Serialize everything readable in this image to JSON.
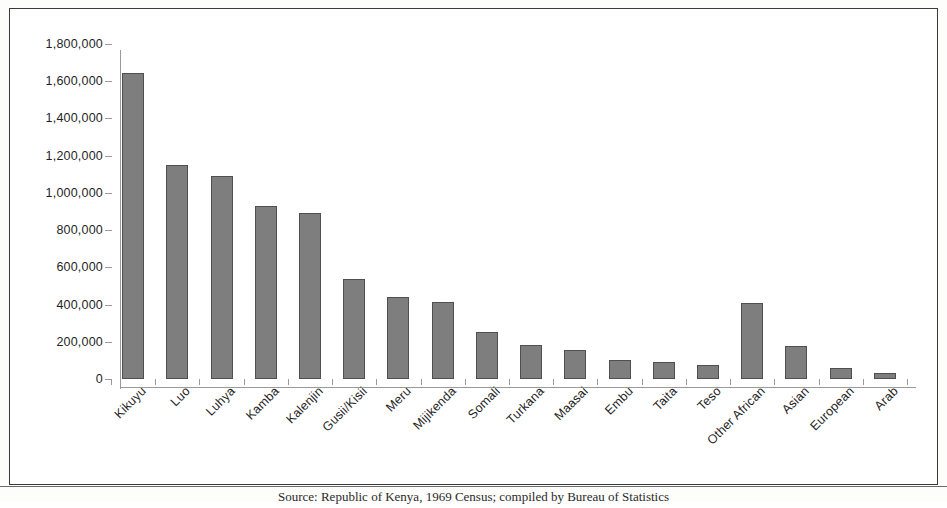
{
  "figure": {
    "frame_border_color": "#3a3a3a",
    "background": "#ffffff"
  },
  "caption": {
    "source_label": "Source:",
    "text": "Source: Republic of Kenya, 1969 Census; compiled by Bureau of Statistics"
  },
  "chart_data": {
    "type": "bar",
    "title": "",
    "xlabel": "",
    "ylabel": "",
    "ylim": [
      0,
      1800000
    ],
    "ytick_step": 200000,
    "grid": false,
    "legend": "none",
    "bar_fill": "#7e7e7e",
    "bar_border": "#4f4f4f",
    "axis_color": "#9a9a9a",
    "ytick_labels": [
      "1,800,000",
      "1,600,000",
      "1,400,000",
      "1,200,000",
      "1,000,000",
      "800,000",
      "600,000",
      "400,000",
      "200,000",
      "0"
    ],
    "ytick_values": [
      1800000,
      1600000,
      1400000,
      1200000,
      1000000,
      800000,
      600000,
      400000,
      200000,
      0
    ],
    "categories": [
      "Kikuyu",
      "Luo",
      "Luhya",
      "Kamba",
      "Kalenjin",
      "Gusii/Kisii",
      "Meru",
      "Mijikenda",
      "Somali",
      "Turkana",
      "Maasai",
      "Embu",
      "Taita",
      "Teso",
      "Other African",
      "Asian",
      "European",
      "Arab"
    ],
    "values": [
      1645000,
      1150000,
      1090000,
      930000,
      890000,
      540000,
      440000,
      415000,
      250000,
      185000,
      155000,
      100000,
      90000,
      75000,
      410000,
      180000,
      60000,
      35000
    ]
  }
}
